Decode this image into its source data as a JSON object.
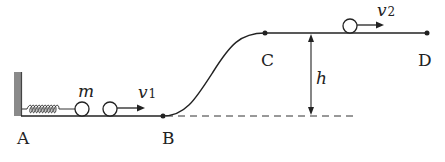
{
  "diagram": {
    "points": {
      "A": {
        "label": "A"
      },
      "B": {
        "label": "B"
      },
      "C": {
        "label": "C"
      },
      "D": {
        "label": "D"
      }
    },
    "mass_label": "m",
    "velocity_1": {
      "symbol": "v",
      "subscript": "1"
    },
    "velocity_2": {
      "symbol": "v",
      "subscript": "2"
    },
    "height_label": "h",
    "colors": {
      "line": "#222222",
      "wall": "#7a7a7a"
    }
  }
}
